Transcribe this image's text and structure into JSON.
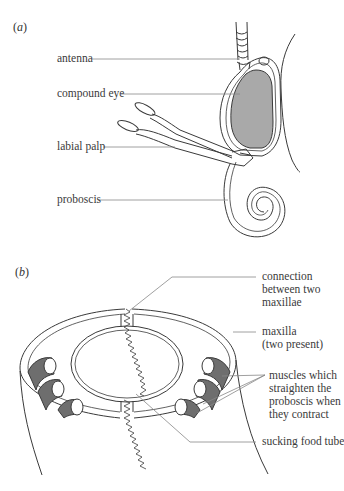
{
  "figure": {
    "panel_a": {
      "label": "a",
      "labels": {
        "antenna": "antenna",
        "compound_eye": "compound eye",
        "labial_palp": "labial palp",
        "proboscis": "proboscis"
      }
    },
    "panel_b": {
      "label": "b",
      "labels": {
        "connection_line1": "connection",
        "connection_line2": "between two",
        "connection_line3": "maxillae",
        "maxilla_line1": "maxilla",
        "maxilla_line2": "(two present)",
        "muscles_line1": "muscles which",
        "muscles_line2": "straighten the",
        "muscles_line3": "proboscis when",
        "muscles_line4": "they contract",
        "food_tube": "sucking food tube"
      }
    },
    "colors": {
      "outline": "#3a3a3a",
      "leader": "#888888",
      "eye_fill": "#a9a9a9",
      "muscle_fill": "#6e6e6e",
      "background": "#ffffff"
    }
  }
}
